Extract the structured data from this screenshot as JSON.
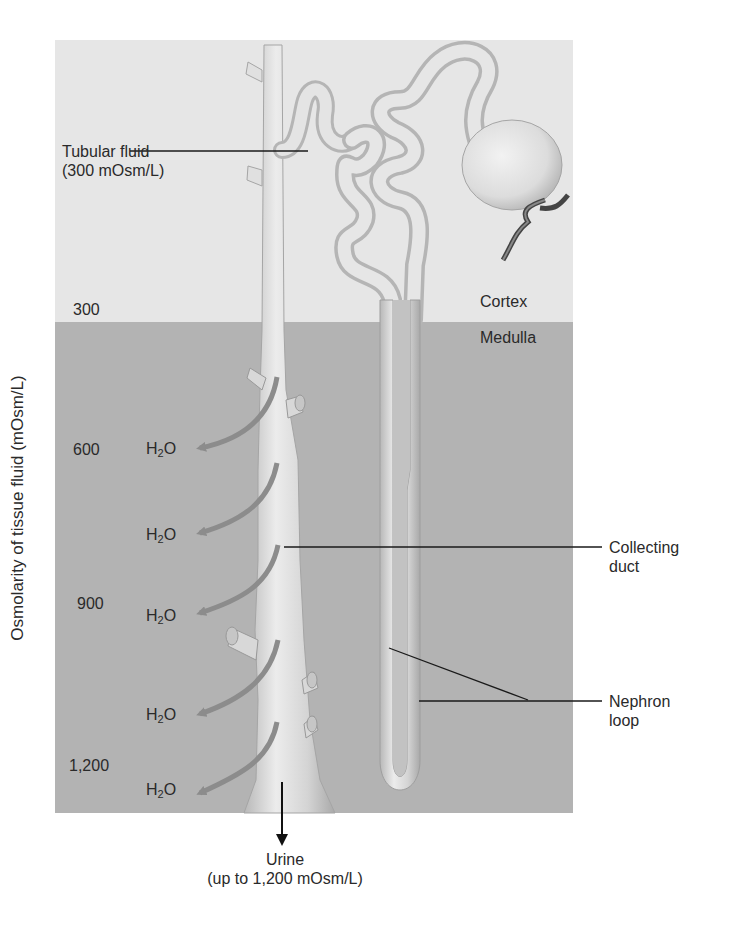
{
  "figure": {
    "regions": {
      "cortex": {
        "label": "Cortex",
        "color": "#e6e6e6"
      },
      "medulla": {
        "label": "Medulla",
        "color": "#b3b3b3"
      }
    },
    "y_axis": {
      "label": "Osmolarity of tissue fluid (mOsm/L)",
      "ticks": [
        "300",
        "600",
        "900",
        "1,200"
      ]
    },
    "callouts": {
      "tubular_fluid": {
        "line1": "Tubular fluid",
        "line2": "(300 mOsm/L)"
      },
      "collecting_duct": {
        "line1": "Collecting",
        "line2": "duct"
      },
      "nephron_loop": {
        "line1": "Nephron",
        "line2": "loop"
      },
      "urine": {
        "line1": "Urine",
        "line2": "(up to 1,200 mOsm/L)"
      }
    },
    "water_labels": [
      {
        "main": "H",
        "sub": "2",
        "tail": "O"
      },
      {
        "main": "H",
        "sub": "2",
        "tail": "O"
      },
      {
        "main": "H",
        "sub": "2",
        "tail": "O"
      },
      {
        "main": "H",
        "sub": "2",
        "tail": "O"
      },
      {
        "main": "H",
        "sub": "2",
        "tail": "O"
      }
    ],
    "colors": {
      "tube": "#d9d9d9",
      "tube_shadow": "#a8a8a8",
      "arrow": "#8c8c8c",
      "vessel": "#555555",
      "leader": "#1a1a1a"
    }
  }
}
